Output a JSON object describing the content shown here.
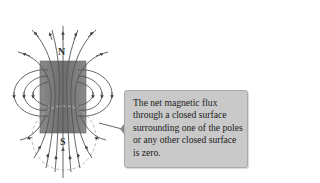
{
  "diagram": {
    "labels": {
      "north_pole": "N",
      "south_pole": "S"
    },
    "callout": {
      "text": "The net magnetic flux through a closed surface surrounding one of the poles or any other closed surface is zero."
    },
    "colors": {
      "magnet": "#7a7a7a",
      "field_lines": "#555555",
      "dashed_surface": "#b5b5b5",
      "callout_bg": "#c9c9c9"
    }
  }
}
